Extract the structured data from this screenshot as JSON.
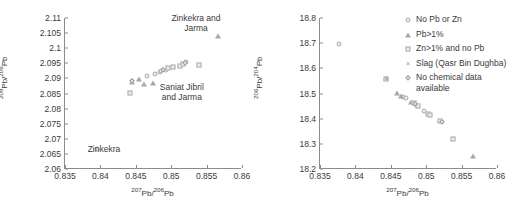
{
  "figure": {
    "panels": [
      "left",
      "right"
    ]
  },
  "chart_data": [
    {
      "type": "scatter",
      "panel": "left",
      "title": "",
      "xlabel": "207Pb/206Pb",
      "ylabel": "208Pb/206Pb",
      "xlim": [
        0.835,
        0.86
      ],
      "ylim": [
        2.06,
        2.11
      ],
      "xticks": [
        "0.835",
        "0.84",
        "0.845",
        "0.85",
        "0.855",
        "0.86"
      ],
      "xtick_values": [
        0.835,
        0.84,
        0.845,
        0.85,
        0.855,
        0.86
      ],
      "yticks": [
        "2.06",
        "2.065",
        "2.07",
        "2.075",
        "2.08",
        "2.085",
        "2.09",
        "2.095",
        "2.1",
        "2.105",
        "2.11"
      ],
      "ytick_values": [
        2.06,
        2.065,
        2.07,
        2.075,
        2.08,
        2.085,
        2.09,
        2.095,
        2.1,
        2.105,
        2.11
      ],
      "grid": false,
      "legend_position": "none",
      "annotations": [
        {
          "text_line1": "Zinkekra and",
          "text_line2": "Jarma",
          "x": 0.8535,
          "y": 2.1085
        },
        {
          "text_line1": "Saniat Jibril",
          "text_line2": "and Jarma",
          "x": 0.8515,
          "y": 2.0855
        },
        {
          "text_line1": "Zinkekra",
          "text_line2": "",
          "x": 0.8405,
          "y": 2.0665
        }
      ],
      "series": [
        {
          "name": "No Pb or Zn",
          "marker": "circle",
          "points": [
            [
              0.8395,
              2.0665
            ],
            [
              0.8466,
              2.0907
            ],
            [
              0.8477,
              2.0913
            ],
            [
              0.8484,
              2.0921
            ],
            [
              0.8486,
              2.0924
            ],
            [
              0.8492,
              2.0928
            ],
            [
              0.8521,
              2.0953
            ]
          ]
        },
        {
          "name": "Pb>1%",
          "marker": "triangle",
          "points": [
            [
              0.8444,
              2.0887
            ],
            [
              0.8455,
              2.0897
            ],
            [
              0.8461,
              2.0882
            ],
            [
              0.8474,
              2.0884
            ],
            [
              0.8566,
              2.1042
            ]
          ]
        },
        {
          "name": "Zn>1% and no Pb",
          "marker": "square",
          "points": [
            [
              0.8442,
              2.0853
            ],
            [
              0.8496,
              2.0935
            ],
            [
              0.8503,
              2.0937
            ],
            [
              0.8512,
              2.0941
            ],
            [
              0.8517,
              2.0947
            ],
            [
              0.8539,
              2.0943
            ]
          ]
        },
        {
          "name": "Slag (Qasr Bin Dughba)",
          "marker": "cross",
          "points": [
            [
              0.8488,
              2.0926
            ]
          ]
        },
        {
          "name": "No chemical data available",
          "marker": "diamond",
          "points": [
            [
              0.8444,
              2.0891
            ],
            [
              0.8489,
              2.0927
            ],
            [
              0.8519,
              2.0951
            ]
          ]
        }
      ]
    },
    {
      "type": "scatter",
      "panel": "right",
      "title": "",
      "xlabel": "207Pb/206Pb",
      "ylabel": "206Pb/204Pb",
      "xlim": [
        0.835,
        0.86
      ],
      "ylim": [
        18.2,
        18.8
      ],
      "xticks": [
        "0.835",
        "0.84",
        "0.845",
        "0.85",
        "0.855",
        "0.86"
      ],
      "xtick_values": [
        0.835,
        0.84,
        0.845,
        0.85,
        0.855,
        0.86
      ],
      "yticks": [
        "18.2",
        "18.3",
        "18.4",
        "18.5",
        "18.6",
        "18.7",
        "18.8"
      ],
      "ytick_values": [
        18.2,
        18.3,
        18.4,
        18.5,
        18.6,
        18.7,
        18.8
      ],
      "grid": false,
      "legend_position": "upper right",
      "annotations": [],
      "series": [
        {
          "name": "No Pb or Zn",
          "marker": "circle",
          "points": [
            [
              0.8377,
              18.697
            ],
            [
              0.8467,
              18.487
            ],
            [
              0.8472,
              18.482
            ],
            [
              0.8482,
              18.462
            ],
            [
              0.8484,
              18.458
            ],
            [
              0.8487,
              18.452
            ],
            [
              0.8497,
              18.432
            ]
          ]
        },
        {
          "name": "Pb>1%",
          "marker": "triangle",
          "points": [
            [
              0.8443,
              18.561
            ],
            [
              0.8459,
              18.501
            ],
            [
              0.8464,
              18.492
            ],
            [
              0.8479,
              18.468
            ],
            [
              0.8566,
              18.252
            ]
          ]
        },
        {
          "name": "Zn>1% and no Pb",
          "marker": "square",
          "points": [
            [
              0.8443,
              18.558
            ],
            [
              0.8483,
              18.461
            ],
            [
              0.8489,
              18.449
            ],
            [
              0.8502,
              18.418
            ],
            [
              0.8506,
              18.416
            ],
            [
              0.8519,
              18.389
            ],
            [
              0.8538,
              18.321
            ]
          ]
        },
        {
          "name": "Slag (Qasr Bin Dughba)",
          "marker": "cross",
          "points": [
            [
              0.8444,
              18.559
            ],
            [
              0.8485,
              18.456
            ]
          ]
        },
        {
          "name": "No chemical data available",
          "marker": "diamond",
          "points": [
            [
              0.8484,
              18.459
            ],
            [
              0.8523,
              18.386
            ]
          ]
        }
      ],
      "legend": [
        {
          "label": "No Pb or Zn",
          "marker": "circle"
        },
        {
          "label": "Pb>1%",
          "marker": "triangle"
        },
        {
          "label": "Zn>1% and no Pb",
          "marker": "square"
        },
        {
          "label": "Slag (Qasr Bin Dughba)",
          "marker": "cross"
        },
        {
          "label": "No chemical data available",
          "marker": "diamond"
        }
      ]
    }
  ],
  "style": {
    "marker_color": "#a8a8a8",
    "marker_fill": "#efefef",
    "axis_color": "#8c8c8c",
    "text_color": "#3a3a3a",
    "background": "#ffffff"
  }
}
